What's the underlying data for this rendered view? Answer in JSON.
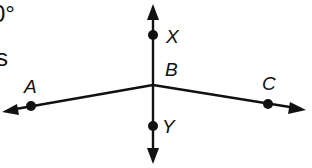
{
  "figure": {
    "partial_text_top": "0°",
    "partial_text_mid": "s",
    "points": {
      "X": "X",
      "B": "B",
      "Y": "Y",
      "A": "A",
      "C": "C"
    },
    "lines": [
      {
        "name": "line-XY",
        "through": [
          "X",
          "B",
          "Y"
        ]
      },
      {
        "name": "ray-BA",
        "from": "B",
        "through": "A"
      },
      {
        "name": "ray-BC",
        "from": "B",
        "through": "C"
      }
    ]
  }
}
